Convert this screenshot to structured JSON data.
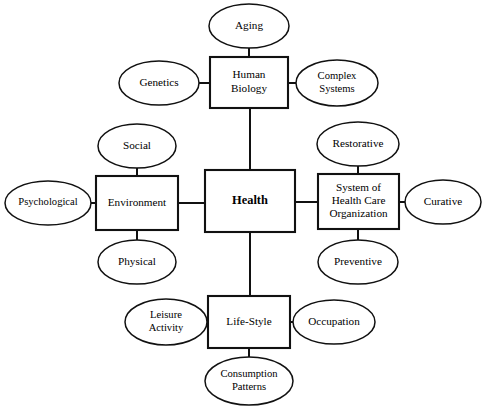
{
  "diagram": {
    "type": "concept-map",
    "background_color": "#ffffff",
    "line_color": "#111111",
    "text_color": "#000000",
    "core": {
      "id": "health",
      "label": "Health",
      "shape": "rectangle",
      "bold": true,
      "x": 205,
      "y": 170,
      "width": 90,
      "height": 62
    },
    "determinants": [
      {
        "id": "human-biology",
        "label_lines": [
          "Human",
          "Biology"
        ],
        "shape": "rectangle",
        "x": 210,
        "y": 57,
        "width": 78,
        "height": 51
      },
      {
        "id": "environment",
        "label_lines": [
          "Environment"
        ],
        "shape": "rectangle",
        "x": 96,
        "y": 176,
        "width": 82,
        "height": 54
      },
      {
        "id": "system-of-health-care-organization",
        "label_lines": [
          "System of",
          "Health Care",
          "Organization"
        ],
        "shape": "rectangle",
        "x": 318,
        "y": 174,
        "width": 81,
        "height": 55
      },
      {
        "id": "life-style",
        "label_lines": [
          "Life-Style"
        ],
        "shape": "rectangle",
        "x": 208,
        "y": 296,
        "width": 82,
        "height": 52
      }
    ],
    "satellites": [
      {
        "id": "aging",
        "label_lines": [
          "Aging"
        ],
        "parent": "human-biology",
        "shape": "ellipse",
        "cx": 249,
        "cy": 26,
        "rx": 40,
        "ry": 22
      },
      {
        "id": "genetics",
        "label_lines": [
          "Genetics"
        ],
        "parent": "human-biology",
        "shape": "ellipse",
        "cx": 159,
        "cy": 83,
        "rx": 40,
        "ry": 22
      },
      {
        "id": "complex-systems",
        "label_lines": [
          "Complex",
          "Systems"
        ],
        "parent": "human-biology",
        "shape": "ellipse",
        "cx": 337,
        "cy": 83,
        "rx": 41,
        "ry": 23
      },
      {
        "id": "social",
        "label_lines": [
          "Social"
        ],
        "parent": "environment",
        "shape": "ellipse",
        "cx": 137,
        "cy": 146,
        "rx": 39,
        "ry": 22
      },
      {
        "id": "psychological",
        "label_lines": [
          "Psychological"
        ],
        "parent": "environment",
        "shape": "ellipse",
        "cx": 48,
        "cy": 203,
        "rx": 43,
        "ry": 22
      },
      {
        "id": "physical",
        "label_lines": [
          "Physical"
        ],
        "parent": "environment",
        "shape": "ellipse",
        "cx": 137,
        "cy": 262,
        "rx": 39,
        "ry": 22
      },
      {
        "id": "restorative",
        "label_lines": [
          "Restorative"
        ],
        "parent": "system-of-health-care-organization",
        "shape": "ellipse",
        "cx": 358,
        "cy": 144,
        "rx": 41,
        "ry": 22
      },
      {
        "id": "curative",
        "label_lines": [
          "Curative"
        ],
        "parent": "system-of-health-care-organization",
        "shape": "ellipse",
        "cx": 443,
        "cy": 202,
        "rx": 38,
        "ry": 22
      },
      {
        "id": "preventive",
        "label_lines": [
          "Preventive"
        ],
        "parent": "system-of-health-care-organization",
        "shape": "ellipse",
        "cx": 358,
        "cy": 262,
        "rx": 40,
        "ry": 22
      },
      {
        "id": "leisure-activity",
        "label_lines": [
          "Leisure",
          "Activity"
        ],
        "parent": "life-style",
        "shape": "ellipse",
        "cx": 166,
        "cy": 322,
        "rx": 41,
        "ry": 23
      },
      {
        "id": "occupation",
        "label_lines": [
          "Occupation"
        ],
        "parent": "life-style",
        "shape": "ellipse",
        "cx": 334,
        "cy": 322,
        "rx": 41,
        "ry": 22
      },
      {
        "id": "consumption-patterns",
        "label_lines": [
          "Consumption",
          "Patterns"
        ],
        "parent": "life-style",
        "shape": "ellipse",
        "cx": 249,
        "cy": 381,
        "rx": 44,
        "ry": 24
      }
    ],
    "connectors": [
      {
        "id": "health-to-human-biology",
        "from": "health",
        "to": "human-biology",
        "x1": 250,
        "y1": 170,
        "x2": 250,
        "y2": 108
      },
      {
        "id": "health-to-environment",
        "from": "health",
        "to": "environment",
        "x1": 205,
        "y1": 203,
        "x2": 178,
        "y2": 203
      },
      {
        "id": "health-to-system",
        "from": "health",
        "to": "system-of-health-care-organization",
        "x1": 295,
        "y1": 202,
        "x2": 318,
        "y2": 202
      },
      {
        "id": "health-to-life-style",
        "from": "health",
        "to": "life-style",
        "x1": 250,
        "y1": 232,
        "x2": 250,
        "y2": 296
      },
      {
        "id": "human-biology-to-aging",
        "from": "human-biology",
        "to": "aging",
        "x1": 249,
        "y1": 57,
        "x2": 249,
        "y2": 48
      },
      {
        "id": "human-biology-to-genetics",
        "from": "human-biology",
        "to": "genetics",
        "x1": 199,
        "y1": 83,
        "x2": 210,
        "y2": 83
      },
      {
        "id": "human-biology-to-complex-systems",
        "from": "human-biology",
        "to": "complex-systems",
        "x1": 288,
        "y1": 83,
        "x2": 296,
        "y2": 83
      },
      {
        "id": "environment-to-social",
        "from": "environment",
        "to": "social",
        "x1": 137,
        "y1": 168,
        "x2": 137,
        "y2": 176
      },
      {
        "id": "environment-to-psychological",
        "from": "environment",
        "to": "psychological",
        "x1": 91,
        "y1": 203,
        "x2": 96,
        "y2": 203
      },
      {
        "id": "environment-to-physical",
        "from": "environment",
        "to": "physical",
        "x1": 137,
        "y1": 230,
        "x2": 137,
        "y2": 240
      },
      {
        "id": "system-to-restorative",
        "from": "system-of-health-care-organization",
        "to": "restorative",
        "x1": 358,
        "y1": 166,
        "x2": 358,
        "y2": 174
      },
      {
        "id": "system-to-curative",
        "from": "system-of-health-care-organization",
        "to": "curative",
        "x1": 399,
        "y1": 202,
        "x2": 405,
        "y2": 202
      },
      {
        "id": "system-to-preventive",
        "from": "system-of-health-care-organization",
        "to": "preventive",
        "x1": 358,
        "y1": 229,
        "x2": 358,
        "y2": 240
      },
      {
        "id": "life-style-to-leisure-activity",
        "from": "life-style",
        "to": "leisure-activity",
        "x1": 207,
        "y1": 322,
        "x2": 197,
        "y2": 322
      },
      {
        "id": "life-style-to-occupation",
        "from": "life-style",
        "to": "occupation",
        "x1": 290,
        "y1": 322,
        "x2": 293,
        "y2": 322
      },
      {
        "id": "life-style-to-consumption-patterns",
        "from": "life-style",
        "to": "consumption-patterns",
        "x1": 249,
        "y1": 348,
        "x2": 249,
        "y2": 357
      }
    ]
  }
}
